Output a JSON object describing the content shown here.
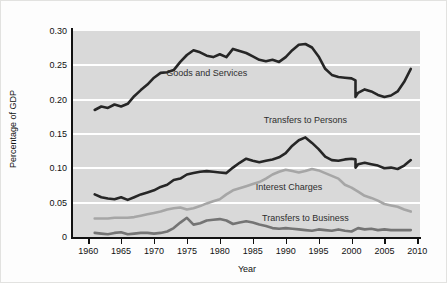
{
  "chart_data": {
    "type": "line",
    "title": "",
    "xlabel": "Year",
    "ylabel": "Percentage of GDP",
    "xlim": [
      1957.7,
      2010.4
    ],
    "ylim": [
      0,
      0.3
    ],
    "x_ticks": [
      1960,
      1965,
      1970,
      1975,
      1980,
      1985,
      1990,
      1995,
      2000,
      2005,
      2010
    ],
    "y_ticks": [
      0,
      0.05,
      0.1,
      0.15,
      0.2,
      0.25,
      0.3
    ],
    "y_tick_labels": [
      "0",
      "0.05",
      "0.10",
      "0.15",
      "0.20",
      "0.25",
      "0.30"
    ],
    "grid": "horizontal white gridlines on gray panel",
    "legend_position": "labels inside plot",
    "panel_color": "#d9d9d9",
    "note": "Vertical step in the two black series at 2000 reflects a data-series break",
    "series": [
      {
        "name": "Goods and Services",
        "color": "#262626",
        "width": 2.6,
        "label_pos": [
          1978,
          0.239
        ],
        "points": [
          [
            1961,
            0.185
          ],
          [
            1962,
            0.19
          ],
          [
            1963,
            0.188
          ],
          [
            1964,
            0.193
          ],
          [
            1965,
            0.19
          ],
          [
            1966,
            0.194
          ],
          [
            1967,
            0.205
          ],
          [
            1968,
            0.214
          ],
          [
            1969,
            0.222
          ],
          [
            1970,
            0.232
          ],
          [
            1971,
            0.239
          ],
          [
            1972,
            0.24
          ],
          [
            1973,
            0.243
          ],
          [
            1974,
            0.255
          ],
          [
            1975,
            0.265
          ],
          [
            1976,
            0.272
          ],
          [
            1977,
            0.269
          ],
          [
            1978,
            0.264
          ],
          [
            1979,
            0.262
          ],
          [
            1980,
            0.266
          ],
          [
            1981,
            0.262
          ],
          [
            1982,
            0.274
          ],
          [
            1983,
            0.271
          ],
          [
            1984,
            0.268
          ],
          [
            1985,
            0.263
          ],
          [
            1986,
            0.258
          ],
          [
            1987,
            0.256
          ],
          [
            1988,
            0.258
          ],
          [
            1989,
            0.255
          ],
          [
            1990,
            0.262
          ],
          [
            1991,
            0.272
          ],
          [
            1992,
            0.28
          ],
          [
            1993,
            0.281
          ],
          [
            1994,
            0.276
          ],
          [
            1995,
            0.263
          ],
          [
            1996,
            0.245
          ],
          [
            1997,
            0.236
          ],
          [
            1998,
            0.233
          ],
          [
            1999,
            0.232
          ],
          [
            2000,
            0.231
          ],
          [
            2000.6,
            0.228
          ],
          [
            2000.6,
            0.204
          ],
          [
            2001,
            0.21
          ],
          [
            2002,
            0.215
          ],
          [
            2003,
            0.212
          ],
          [
            2004,
            0.207
          ],
          [
            2005,
            0.204
          ],
          [
            2006,
            0.206
          ],
          [
            2007,
            0.212
          ],
          [
            2008,
            0.226
          ],
          [
            2009,
            0.245
          ]
        ]
      },
      {
        "name": "Transfers to Persons",
        "color": "#262626",
        "width": 2.6,
        "label_pos": [
          1993,
          0.171
        ],
        "points": [
          [
            1961,
            0.062
          ],
          [
            1962,
            0.058
          ],
          [
            1963,
            0.056
          ],
          [
            1964,
            0.055
          ],
          [
            1965,
            0.058
          ],
          [
            1966,
            0.054
          ],
          [
            1967,
            0.058
          ],
          [
            1968,
            0.062
          ],
          [
            1969,
            0.065
          ],
          [
            1970,
            0.068
          ],
          [
            1971,
            0.073
          ],
          [
            1972,
            0.076
          ],
          [
            1973,
            0.083
          ],
          [
            1974,
            0.085
          ],
          [
            1975,
            0.091
          ],
          [
            1976,
            0.093
          ],
          [
            1977,
            0.095
          ],
          [
            1978,
            0.096
          ],
          [
            1979,
            0.095
          ],
          [
            1980,
            0.094
          ],
          [
            1981,
            0.093
          ],
          [
            1982,
            0.101
          ],
          [
            1983,
            0.108
          ],
          [
            1984,
            0.114
          ],
          [
            1985,
            0.111
          ],
          [
            1986,
            0.109
          ],
          [
            1987,
            0.111
          ],
          [
            1988,
            0.113
          ],
          [
            1989,
            0.116
          ],
          [
            1990,
            0.122
          ],
          [
            1991,
            0.133
          ],
          [
            1992,
            0.141
          ],
          [
            1993,
            0.145
          ],
          [
            1994,
            0.137
          ],
          [
            1995,
            0.128
          ],
          [
            1996,
            0.117
          ],
          [
            1997,
            0.112
          ],
          [
            1998,
            0.111
          ],
          [
            1999,
            0.113
          ],
          [
            2000,
            0.114
          ],
          [
            2000.6,
            0.113
          ],
          [
            2000.6,
            0.101
          ],
          [
            2001,
            0.106
          ],
          [
            2002,
            0.108
          ],
          [
            2003,
            0.106
          ],
          [
            2004,
            0.104
          ],
          [
            2005,
            0.1
          ],
          [
            2006,
            0.101
          ],
          [
            2007,
            0.099
          ],
          [
            2008,
            0.104
          ],
          [
            2009,
            0.112
          ]
        ]
      },
      {
        "name": "Interest Charges",
        "color": "#a6a6a6",
        "width": 2.6,
        "label_pos": [
          1990.5,
          0.073
        ],
        "points": [
          [
            1961,
            0.027
          ],
          [
            1962,
            0.027
          ],
          [
            1963,
            0.027
          ],
          [
            1964,
            0.028
          ],
          [
            1965,
            0.028
          ],
          [
            1966,
            0.028
          ],
          [
            1967,
            0.029
          ],
          [
            1968,
            0.031
          ],
          [
            1969,
            0.033
          ],
          [
            1970,
            0.035
          ],
          [
            1971,
            0.037
          ],
          [
            1972,
            0.04
          ],
          [
            1973,
            0.042
          ],
          [
            1974,
            0.043
          ],
          [
            1975,
            0.04
          ],
          [
            1976,
            0.042
          ],
          [
            1977,
            0.045
          ],
          [
            1978,
            0.049
          ],
          [
            1979,
            0.052
          ],
          [
            1980,
            0.055
          ],
          [
            1981,
            0.062
          ],
          [
            1982,
            0.068
          ],
          [
            1983,
            0.071
          ],
          [
            1984,
            0.074
          ],
          [
            1985,
            0.077
          ],
          [
            1986,
            0.08
          ],
          [
            1987,
            0.085
          ],
          [
            1988,
            0.091
          ],
          [
            1989,
            0.095
          ],
          [
            1990,
            0.098
          ],
          [
            1991,
            0.096
          ],
          [
            1992,
            0.094
          ],
          [
            1993,
            0.096
          ],
          [
            1994,
            0.099
          ],
          [
            1995,
            0.097
          ],
          [
            1996,
            0.093
          ],
          [
            1997,
            0.089
          ],
          [
            1998,
            0.085
          ],
          [
            1999,
            0.076
          ],
          [
            2000,
            0.072
          ],
          [
            2001,
            0.066
          ],
          [
            2002,
            0.06
          ],
          [
            2003,
            0.057
          ],
          [
            2004,
            0.053
          ],
          [
            2005,
            0.048
          ],
          [
            2006,
            0.046
          ],
          [
            2007,
            0.044
          ],
          [
            2008,
            0.04
          ],
          [
            2009,
            0.037
          ]
        ]
      },
      {
        "name": "Transfers to Business",
        "color": "#747474",
        "width": 2.6,
        "label_pos": [
          1993,
          0.028
        ],
        "points": [
          [
            1961,
            0.006
          ],
          [
            1962,
            0.005
          ],
          [
            1963,
            0.004
          ],
          [
            1964,
            0.006
          ],
          [
            1965,
            0.007
          ],
          [
            1966,
            0.004
          ],
          [
            1967,
            0.005
          ],
          [
            1968,
            0.006
          ],
          [
            1969,
            0.006
          ],
          [
            1970,
            0.005
          ],
          [
            1971,
            0.006
          ],
          [
            1972,
            0.008
          ],
          [
            1973,
            0.013
          ],
          [
            1974,
            0.021
          ],
          [
            1975,
            0.028
          ],
          [
            1976,
            0.018
          ],
          [
            1977,
            0.02
          ],
          [
            1978,
            0.024
          ],
          [
            1979,
            0.025
          ],
          [
            1980,
            0.026
          ],
          [
            1981,
            0.024
          ],
          [
            1982,
            0.019
          ],
          [
            1983,
            0.021
          ],
          [
            1984,
            0.023
          ],
          [
            1985,
            0.021
          ],
          [
            1986,
            0.018
          ],
          [
            1987,
            0.016
          ],
          [
            1988,
            0.013
          ],
          [
            1989,
            0.012
          ],
          [
            1990,
            0.013
          ],
          [
            1991,
            0.012
          ],
          [
            1992,
            0.011
          ],
          [
            1993,
            0.01
          ],
          [
            1994,
            0.009
          ],
          [
            1995,
            0.011
          ],
          [
            1996,
            0.01
          ],
          [
            1997,
            0.009
          ],
          [
            1998,
            0.011
          ],
          [
            1999,
            0.009
          ],
          [
            2000,
            0.008
          ],
          [
            2001,
            0.013
          ],
          [
            2002,
            0.011
          ],
          [
            2003,
            0.012
          ],
          [
            2004,
            0.01
          ],
          [
            2005,
            0.011
          ],
          [
            2006,
            0.01
          ],
          [
            2007,
            0.01
          ],
          [
            2008,
            0.01
          ],
          [
            2009,
            0.01
          ]
        ]
      }
    ]
  }
}
